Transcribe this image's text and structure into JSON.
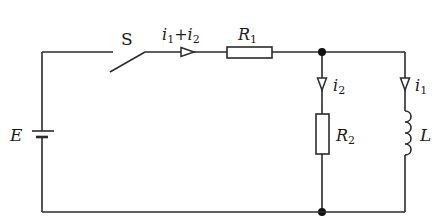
{
  "diagram": {
    "type": "circuit-schematic",
    "components": {
      "source": {
        "label": "E",
        "kind": "battery"
      },
      "switch": {
        "label": "S",
        "state": "open"
      },
      "r1": {
        "label": "R",
        "sub": "1",
        "kind": "resistor"
      },
      "r2": {
        "label": "R",
        "sub": "2",
        "kind": "resistor"
      },
      "inductor": {
        "label": "L",
        "kind": "inductor"
      }
    },
    "currents": {
      "main": {
        "a": "i",
        "a_sub": "1",
        "op": "+",
        "b": "i",
        "b_sub": "2"
      },
      "branch_r2": {
        "label": "i",
        "sub": "2"
      },
      "branch_l": {
        "label": "i",
        "sub": "1"
      }
    },
    "colors": {
      "line": "#2b2b2b",
      "background": "#ffffff"
    }
  }
}
